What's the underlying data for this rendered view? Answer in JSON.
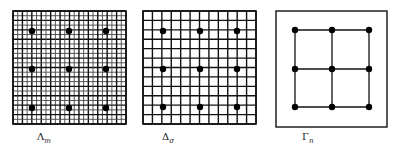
{
  "panels": [
    {
      "id": "lambda",
      "label_main": "Λ",
      "label_sub": "m",
      "grid": {
        "x": 13,
        "y": 11,
        "size": 113,
        "cells": 24,
        "major_every": 2
      },
      "dots_x": [
        32,
        69,
        106
      ],
      "dots_y": [
        31,
        69,
        108
      ]
    },
    {
      "id": "delta",
      "label_main": "Δ",
      "label_sub": "σ",
      "grid": {
        "x": 143,
        "y": 11,
        "size": 113,
        "cells": 12,
        "major_every": 1
      },
      "dots_x": [
        163,
        200,
        237
      ],
      "dots_y": [
        31,
        69,
        107
      ]
    },
    {
      "id": "gamma",
      "label_main": "Γ",
      "label_sub": "n",
      "frame": {
        "x": 276,
        "y": 11,
        "width": 111,
        "height": 116
      },
      "nodes_x": [
        295,
        332,
        369
      ],
      "nodes_y": [
        30,
        69,
        107
      ]
    }
  ],
  "colors": {
    "line": "#111111",
    "fine_line": "#444444",
    "dot": "#000000",
    "background": "#ffffff"
  }
}
